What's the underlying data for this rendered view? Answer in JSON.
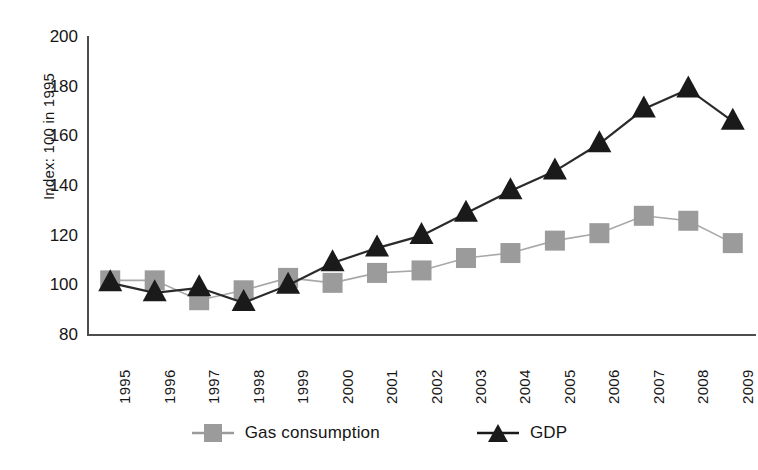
{
  "chart_data": {
    "type": "line",
    "title": "",
    "subtitle": "",
    "xlabel": "",
    "ylabel": "Index: 100 in 1995",
    "categories": [
      "1995",
      "1996",
      "1997",
      "1998",
      "1999",
      "2000",
      "2001",
      "2002",
      "2003",
      "2004",
      "2005",
      "2006",
      "2007",
      "2008",
      "2009"
    ],
    "x": [
      1995,
      1996,
      1997,
      1998,
      1999,
      2000,
      2001,
      2002,
      2003,
      2004,
      2005,
      2006,
      2007,
      2008,
      2009
    ],
    "ylim": [
      80,
      200
    ],
    "yticks": [
      80,
      100,
      120,
      140,
      160,
      180,
      200
    ],
    "ytick_labels": [
      "80",
      "100",
      "120",
      "140",
      "160",
      "180",
      "200"
    ],
    "grid": false,
    "legend_position": "bottom",
    "series": [
      {
        "name": "Gas consumption",
        "marker": "square",
        "color": "#9b9b9b",
        "line_color": "#a8a8a8",
        "values": [
          102,
          102,
          94,
          98,
          103,
          101,
          105,
          106,
          111,
          113,
          118,
          121,
          128,
          126,
          117
        ]
      },
      {
        "name": "GDP",
        "marker": "triangle",
        "color": "#1a1a1a",
        "line_color": "#2b2b2b",
        "values": [
          101,
          97,
          99,
          93,
          100,
          109,
          115,
          120,
          129,
          138,
          146,
          157,
          171,
          179,
          166
        ]
      }
    ]
  },
  "axis": {
    "y_label": "Index: 100 in 1995",
    "y_tick_labels": [
      "200",
      "180",
      "160",
      "140",
      "120",
      "100",
      "80"
    ],
    "x_tick_labels": [
      "1995",
      "1996",
      "1997",
      "1998",
      "1999",
      "2000",
      "2001",
      "2002",
      "2003",
      "2004",
      "2005",
      "2006",
      "2007",
      "2008",
      "2009"
    ]
  },
  "legend": {
    "items": [
      {
        "label": "Gas consumption",
        "marker": "square-marker",
        "color": "#9b9b9b"
      },
      {
        "label": "GDP",
        "marker": "triangle-marker",
        "color": "#1a1a1a"
      }
    ]
  }
}
